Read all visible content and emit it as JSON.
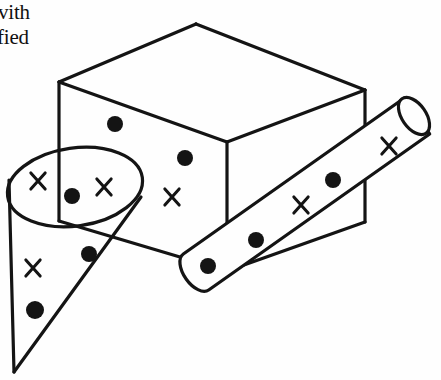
{
  "figure": {
    "caption_fragments": [
      {
        "text": "vith",
        "x": -2,
        "y": 0
      },
      {
        "text": "fied",
        "x": -3,
        "y": 25
      }
    ],
    "ink_color": "#141414",
    "background_color": "#fefefe",
    "stroke_width": 3.2,
    "box": {
      "name": "cuboid",
      "top_face": [
        [
          59,
          82
        ],
        [
          196,
          24
        ],
        [
          365,
          90
        ],
        [
          227,
          142
        ]
      ],
      "left_face": [
        [
          59,
          82
        ],
        [
          227,
          142
        ],
        [
          227,
          271
        ],
        [
          59,
          221
        ]
      ],
      "right_face": [
        [
          227,
          142
        ],
        [
          365,
          90
        ],
        [
          365,
          222
        ],
        [
          227,
          271
        ]
      ],
      "visible_edges": [
        [
          [
            59,
            82
          ],
          [
            196,
            24
          ]
        ],
        [
          [
            196,
            24
          ],
          [
            365,
            90
          ]
        ],
        [
          [
            365,
            90
          ],
          [
            227,
            142
          ]
        ],
        [
          [
            227,
            142
          ],
          [
            59,
            82
          ]
        ],
        [
          [
            59,
            82
          ],
          [
            59,
            221
          ]
        ],
        [
          [
            227,
            142
          ],
          [
            227,
            271
          ]
        ],
        [
          [
            365,
            90
          ],
          [
            365,
            222
          ]
        ],
        [
          [
            227,
            271
          ],
          [
            365,
            222
          ]
        ],
        [
          [
            59,
            221
          ],
          [
            227,
            271
          ]
        ]
      ]
    },
    "cone": {
      "name": "sampling-cone",
      "ellipse": {
        "cx": 75,
        "cy": 187,
        "rx": 68,
        "ry": 39,
        "rotation": -8
      },
      "apex": [
        14,
        372
      ],
      "side_lines": [
        [
          [
            9,
            180
          ],
          [
            14,
            372
          ]
        ],
        [
          [
            141,
            197
          ],
          [
            14,
            372
          ]
        ]
      ]
    },
    "cylinder": {
      "name": "sampling-cylinder",
      "axis_start": [
        196,
        272
      ],
      "axis_end": [
        417,
        116
      ],
      "radius": 22,
      "cap_ellipse": {
        "cx": 414,
        "cy": 116,
        "rx": 12,
        "ry": 21,
        "rotation": -35
      }
    },
    "markers": {
      "dots": [
        {
          "cx": 115,
          "cy": 124,
          "r": 8,
          "region": "box-left-face"
        },
        {
          "cx": 185,
          "cy": 158,
          "r": 8,
          "region": "box-left-face"
        },
        {
          "cx": 72,
          "cy": 196,
          "r": 8,
          "region": "cone-ellipse"
        },
        {
          "cx": 89,
          "cy": 254,
          "r": 8,
          "region": "cone-body"
        },
        {
          "cx": 35,
          "cy": 310,
          "r": 9,
          "region": "cone-body"
        },
        {
          "cx": 333,
          "cy": 180,
          "r": 8,
          "region": "cylinder"
        },
        {
          "cx": 256,
          "cy": 240,
          "r": 8,
          "region": "cylinder"
        },
        {
          "cx": 208,
          "cy": 266,
          "r": 8,
          "region": "cylinder"
        }
      ],
      "crosses": [
        {
          "cx": 38,
          "cy": 181,
          "size": 13,
          "region": "cone-ellipse"
        },
        {
          "cx": 104,
          "cy": 187,
          "size": 13,
          "region": "cone-ellipse"
        },
        {
          "cx": 172,
          "cy": 197,
          "size": 13,
          "region": "box-left-face"
        },
        {
          "cx": 33,
          "cy": 268,
          "size": 13,
          "region": "cone-body"
        },
        {
          "cx": 301,
          "cy": 205,
          "size": 13,
          "region": "cylinder"
        },
        {
          "cx": 389,
          "cy": 146,
          "size": 13,
          "region": "cylinder"
        }
      ],
      "dot_count": 8,
      "cross_count": 6
    }
  }
}
